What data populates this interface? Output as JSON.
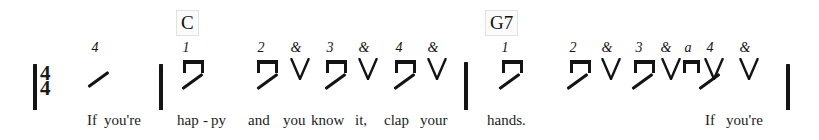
{
  "sheet": {
    "title": "If You're Happy And You Know It - strumming pattern",
    "time_signature": {
      "top": "4",
      "bottom": "4"
    },
    "ink_color": "#141414",
    "background_color": "#ffffff"
  },
  "barlines": [
    {
      "name": "barline-opening",
      "x": 33,
      "y": 64,
      "height": 46
    },
    {
      "name": "barline-1",
      "x": 159,
      "y": 64,
      "height": 46
    },
    {
      "name": "barline-2",
      "x": 464,
      "y": 62,
      "height": 48
    },
    {
      "name": "barline-final",
      "x": 786,
      "y": 64,
      "height": 46
    }
  ],
  "chords": [
    {
      "name": "chord-c",
      "label": "C",
      "x": 176,
      "y": 10
    },
    {
      "name": "chord-g7",
      "label": "G7",
      "x": 485,
      "y": 10
    }
  ],
  "counts": [
    {
      "label": "4",
      "x": 95,
      "y": 41
    },
    {
      "label": "1",
      "x": 186,
      "y": 41
    },
    {
      "label": "2",
      "x": 261,
      "y": 41
    },
    {
      "label": "&",
      "x": 296,
      "y": 41
    },
    {
      "label": "3",
      "x": 330,
      "y": 41
    },
    {
      "label": "&",
      "x": 364,
      "y": 41
    },
    {
      "label": "4",
      "x": 399,
      "y": 41
    },
    {
      "label": "&",
      "x": 433,
      "y": 41
    },
    {
      "label": "1",
      "x": 505,
      "y": 41
    },
    {
      "label": "2",
      "x": 573,
      "y": 41
    },
    {
      "label": "&",
      "x": 607,
      "y": 41
    },
    {
      "label": "3",
      "x": 639,
      "y": 41
    },
    {
      "label": "&",
      "x": 666,
      "y": 41
    },
    {
      "label": "a",
      "x": 688,
      "y": 41
    },
    {
      "label": "4",
      "x": 710,
      "y": 41
    },
    {
      "label": "&",
      "x": 745,
      "y": 41
    }
  ],
  "strokes": [
    {
      "name": "stroke-down-1",
      "type": "down",
      "x": 183,
      "y": 60,
      "width": 21,
      "height": 13
    },
    {
      "name": "stroke-down-2",
      "type": "down",
      "x": 257,
      "y": 60,
      "width": 21,
      "height": 13
    },
    {
      "name": "stroke-up-2and",
      "type": "up",
      "x": 290,
      "y": 58,
      "width": 20,
      "height": 22
    },
    {
      "name": "stroke-down-3",
      "type": "down",
      "x": 326,
      "y": 60,
      "width": 21,
      "height": 13
    },
    {
      "name": "stroke-up-3and",
      "type": "up",
      "x": 358,
      "y": 58,
      "width": 20,
      "height": 22
    },
    {
      "name": "stroke-down-4",
      "type": "down",
      "x": 395,
      "y": 60,
      "width": 21,
      "height": 13
    },
    {
      "name": "stroke-up-4and",
      "type": "up",
      "x": 427,
      "y": 58,
      "width": 20,
      "height": 22
    },
    {
      "name": "stroke-down-5",
      "type": "down",
      "x": 502,
      "y": 60,
      "width": 21,
      "height": 13
    },
    {
      "name": "stroke-down-6",
      "type": "down",
      "x": 570,
      "y": 60,
      "width": 21,
      "height": 13
    },
    {
      "name": "stroke-up-6and",
      "type": "up",
      "x": 601,
      "y": 58,
      "width": 20,
      "height": 22
    },
    {
      "name": "stroke-down-7",
      "type": "down",
      "x": 634,
      "y": 60,
      "width": 21,
      "height": 13
    },
    {
      "name": "stroke-up-7and",
      "type": "up",
      "x": 661,
      "y": 58,
      "width": 20,
      "height": 22
    },
    {
      "name": "stroke-down-a",
      "type": "down",
      "x": 683,
      "y": 60,
      "width": 17,
      "height": 13
    },
    {
      "name": "stroke-up-8",
      "type": "up",
      "x": 704,
      "y": 58,
      "width": 20,
      "height": 22
    },
    {
      "name": "stroke-up-8and",
      "type": "up",
      "x": 739,
      "y": 58,
      "width": 20,
      "height": 22
    }
  ],
  "slashes": [
    {
      "name": "slash-pickup",
      "x": 86,
      "y": 78,
      "length": 25
    },
    {
      "name": "slash-1",
      "x": 180,
      "y": 80,
      "length": 25
    },
    {
      "name": "slash-2",
      "x": 255,
      "y": 80,
      "length": 25
    },
    {
      "name": "slash-3",
      "x": 323,
      "y": 80,
      "length": 25
    },
    {
      "name": "slash-4",
      "x": 392,
      "y": 80,
      "length": 25
    },
    {
      "name": "slash-5",
      "x": 497,
      "y": 80,
      "length": 25
    },
    {
      "name": "slash-6",
      "x": 565,
      "y": 80,
      "length": 25
    },
    {
      "name": "slash-7",
      "x": 630,
      "y": 80,
      "length": 25
    },
    {
      "name": "slash-8",
      "x": 697,
      "y": 80,
      "length": 25
    }
  ],
  "lyrics": [
    {
      "text": "If",
      "x": 87,
      "y": 112
    },
    {
      "text": "you're",
      "x": 104,
      "y": 112
    },
    {
      "text": "hap",
      "x": 177,
      "y": 112
    },
    {
      "text": "-",
      "x": 203,
      "y": 112
    },
    {
      "text": "py",
      "x": 211,
      "y": 112
    },
    {
      "text": "and",
      "x": 248,
      "y": 112
    },
    {
      "text": "you",
      "x": 283,
      "y": 112
    },
    {
      "text": "know",
      "x": 311,
      "y": 112
    },
    {
      "text": "it,",
      "x": 355,
      "y": 112
    },
    {
      "text": "clap",
      "x": 384,
      "y": 112
    },
    {
      "text": "your",
      "x": 420,
      "y": 112
    },
    {
      "text": "hands.",
      "x": 487,
      "y": 112
    },
    {
      "text": "If",
      "x": 705,
      "y": 112
    },
    {
      "text": "you're",
      "x": 726,
      "y": 112
    }
  ]
}
